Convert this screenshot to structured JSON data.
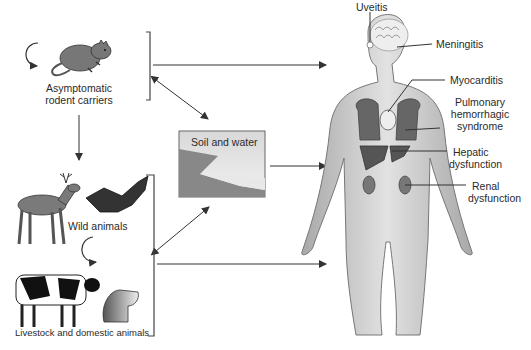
{
  "sources": {
    "rodents": {
      "label_line1": "Asymptomatic",
      "label_line2": "rodent carriers"
    },
    "wild": {
      "label": "Wild animals"
    },
    "livestock": {
      "label": "Livestock and domestic animals"
    },
    "environment": {
      "label": "Soil and water"
    }
  },
  "human": {
    "manifestations": [
      {
        "id": "uveitis",
        "lines": [
          "Uveitis"
        ]
      },
      {
        "id": "meningitis",
        "lines": [
          "Meningitis"
        ]
      },
      {
        "id": "myocarditis",
        "lines": [
          "Myocarditis"
        ]
      },
      {
        "id": "pulmonary",
        "lines": [
          "Pulmonary",
          "hemorrhagic",
          "syndrome"
        ]
      },
      {
        "id": "hepatic",
        "lines": [
          "Hepatic",
          "dysfunction"
        ]
      },
      {
        "id": "renal",
        "lines": [
          "Renal",
          "dysfunction"
        ]
      }
    ]
  },
  "colors": {
    "line": "#333333",
    "body": "#c8c8c8",
    "organ": "#6a6a6a",
    "animal": "#7a7a7a"
  }
}
